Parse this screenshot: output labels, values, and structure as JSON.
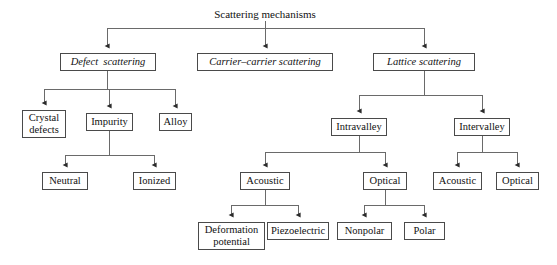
{
  "diagram": {
    "title": "Scattering mechanisms",
    "title_pos": {
      "x": 192,
      "y": 8,
      "w": 146
    },
    "edge_color": "#5a5a5a",
    "box_border_color": "#4a4a4a",
    "nodes": [
      {
        "id": "defect",
        "label": "Defect  scattering",
        "x": 60,
        "y": 53,
        "w": 96,
        "h": 18,
        "style": "italic"
      },
      {
        "id": "carrier",
        "label": "Carrier–carrier scattering",
        "x": 197,
        "y": 53,
        "w": 136,
        "h": 18,
        "style": "italic"
      },
      {
        "id": "lattice",
        "label": "Lattice scattering",
        "x": 373,
        "y": 53,
        "w": 102,
        "h": 18,
        "style": "italic"
      },
      {
        "id": "crystal",
        "label": "Crystal\ndefects",
        "x": 22,
        "y": 110,
        "w": 44,
        "h": 28,
        "style": "two-line"
      },
      {
        "id": "impurity",
        "label": "Impurity",
        "x": 86,
        "y": 113,
        "w": 47,
        "h": 18,
        "style": "plain"
      },
      {
        "id": "alloy",
        "label": "Alloy",
        "x": 159,
        "y": 113,
        "w": 33,
        "h": 18,
        "style": "plain"
      },
      {
        "id": "neutral",
        "label": "Neutral",
        "x": 42,
        "y": 172,
        "w": 46,
        "h": 18,
        "style": "plain"
      },
      {
        "id": "ionized",
        "label": "Ionized",
        "x": 133,
        "y": 172,
        "w": 43,
        "h": 18,
        "style": "plain"
      },
      {
        "id": "intravalley",
        "label": "Intravalley",
        "x": 331,
        "y": 118,
        "w": 56,
        "h": 18,
        "style": "plain"
      },
      {
        "id": "intervalley",
        "label": "Intervalley",
        "x": 454,
        "y": 118,
        "w": 56,
        "h": 18,
        "style": "plain"
      },
      {
        "id": "acoustic-intra",
        "label": "Acoustic",
        "x": 240,
        "y": 172,
        "w": 50,
        "h": 18,
        "style": "plain"
      },
      {
        "id": "optical-intra",
        "label": "Optical",
        "x": 363,
        "y": 172,
        "w": 44,
        "h": 18,
        "style": "plain"
      },
      {
        "id": "acoustic-inter",
        "label": "Acoustic",
        "x": 433,
        "y": 172,
        "w": 49,
        "h": 18,
        "style": "plain"
      },
      {
        "id": "optical-inter",
        "label": "Optical",
        "x": 496,
        "y": 172,
        "w": 43,
        "h": 18,
        "style": "plain"
      },
      {
        "id": "deformation",
        "label": "Deformation\npotential",
        "x": 198,
        "y": 222,
        "w": 67,
        "h": 28,
        "style": "two-line"
      },
      {
        "id": "piezoelectric",
        "label": "Piezoelectric",
        "x": 267,
        "y": 222,
        "w": 62,
        "h": 18,
        "style": "plain"
      },
      {
        "id": "nonpolar",
        "label": "Nonpolar",
        "x": 337,
        "y": 222,
        "w": 55,
        "h": 18,
        "style": "plain"
      },
      {
        "id": "polar",
        "label": "Polar",
        "x": 404,
        "y": 222,
        "w": 41,
        "h": 18,
        "style": "plain"
      }
    ],
    "edges": [
      {
        "from": "Scattering mechanisms",
        "to": [
          "Defect  scattering",
          "Carrier–carrier scattering",
          "Lattice scattering"
        ]
      },
      {
        "from": "Defect  scattering",
        "to": [
          "Crystal defects",
          "Impurity",
          "Alloy"
        ]
      },
      {
        "from": "Impurity",
        "to": [
          "Neutral",
          "Ionized"
        ]
      },
      {
        "from": "Lattice scattering",
        "to": [
          "Intravalley",
          "Intervalley"
        ]
      },
      {
        "from": "Intravalley",
        "to": [
          "Acoustic",
          "Optical"
        ]
      },
      {
        "from": "Intervalley",
        "to": [
          "Acoustic",
          "Optical"
        ]
      },
      {
        "from": "Acoustic",
        "to": [
          "Deformation potential",
          "Piezoelectric"
        ]
      },
      {
        "from": "Optical",
        "to": [
          "Nonpolar",
          "Polar"
        ]
      }
    ]
  }
}
